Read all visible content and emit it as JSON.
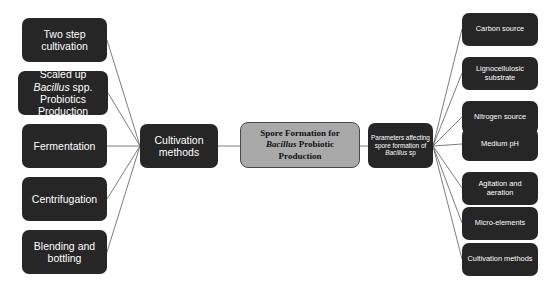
{
  "diagram": {
    "background_color": "#ffffff",
    "node_dark_color": "#262626",
    "node_center_color": "#a9a9a9",
    "connector_color": "#6e6e6e",
    "center_node": {
      "line1": "Spore Formation for",
      "line2_italic": "Bacillus",
      "line2_rest": " Probiotic",
      "line3": "Production"
    },
    "left_hub": {
      "label": "Cultivation methods"
    },
    "right_hub": {
      "line1": "Parameters affecting",
      "line2": "spore formation of",
      "line3_italic": "Bacillus",
      "line3_rest": " sp"
    },
    "left_nodes": [
      {
        "label": "Two step cultivation",
        "top": 18
      },
      {
        "label": "Scaled up Bacillus spp. Probiotics Production",
        "italic_word": "Bacillus",
        "top": 71,
        "wide": true
      },
      {
        "label": "Fermentation",
        "top": 124
      },
      {
        "label": "Centrifugation",
        "top": 177
      },
      {
        "label": "Blending and bottling",
        "top": 230
      }
    ],
    "right_nodes": [
      {
        "label": "Carbon source",
        "top": 13
      },
      {
        "label": "Lignocellulosic substrate",
        "top": 57
      },
      {
        "label": "Nitrogen source",
        "top": 101
      },
      {
        "label": "Medium  pH",
        "top": 128
      },
      {
        "label": "Agitation and aeration",
        "top": 172
      },
      {
        "label": "Micro-elements",
        "top": 207
      },
      {
        "label": "Cultivation methods",
        "top": 243
      }
    ]
  }
}
